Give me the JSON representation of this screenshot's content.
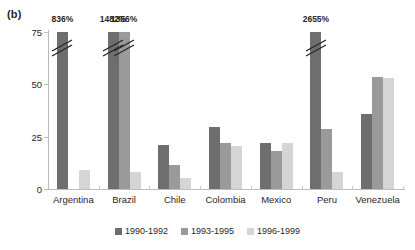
{
  "panel": {
    "label": "(b)"
  },
  "chart_data": {
    "type": "bar",
    "title": "",
    "xlabel": "",
    "ylabel": "",
    "ylim": [
      0,
      75
    ],
    "yticks": [
      0,
      25,
      50,
      75
    ],
    "grid": false,
    "legend_position": "bottom",
    "categories": [
      "Argentina",
      "Brazil",
      "Chile",
      "Colombia",
      "Mexico",
      "Peru",
      "Venezuela"
    ],
    "series": [
      {
        "name": "1990-1992",
        "color": "#6e6e6e",
        "values": [
          836,
          1482,
          21,
          29.5,
          22,
          2655,
          36
        ],
        "truncated": [
          true,
          true,
          false,
          false,
          false,
          true,
          false
        ],
        "labels": [
          "836%",
          "1482%",
          "",
          "",
          "",
          "2655%",
          ""
        ]
      },
      {
        "name": "1993-1995",
        "color": "#9a9a9a",
        "values": [
          null,
          1356,
          11.5,
          22,
          18,
          28.5,
          53.5
        ],
        "truncated": [
          false,
          true,
          false,
          false,
          false,
          false,
          false
        ],
        "labels": [
          "",
          "1356%",
          "",
          "",
          "",
          "",
          ""
        ]
      },
      {
        "name": "1996-1999",
        "color": "#d5d5d5",
        "values": [
          9,
          8,
          5.5,
          20.5,
          22,
          8,
          53
        ],
        "truncated": [
          false,
          false,
          false,
          false,
          false,
          false,
          false
        ],
        "labels": [
          "",
          "",
          "",
          "",
          "",
          "",
          ""
        ]
      }
    ],
    "annotations": [
      {
        "text": "836%",
        "category": "Argentina",
        "series": "1990-1992"
      },
      {
        "text": "1482%",
        "category": "Brazil",
        "series": "1990-1992"
      },
      {
        "text": "1356%",
        "category": "Brazil",
        "series": "1993-1995"
      },
      {
        "text": "2655%",
        "category": "Peru",
        "series": "1990-1992"
      }
    ]
  },
  "legend": {
    "items": [
      {
        "label": "1990-1992",
        "color": "#6e6e6e"
      },
      {
        "label": "1993-1995",
        "color": "#9a9a9a"
      },
      {
        "label": "1996-1999",
        "color": "#d5d5d5"
      }
    ]
  }
}
